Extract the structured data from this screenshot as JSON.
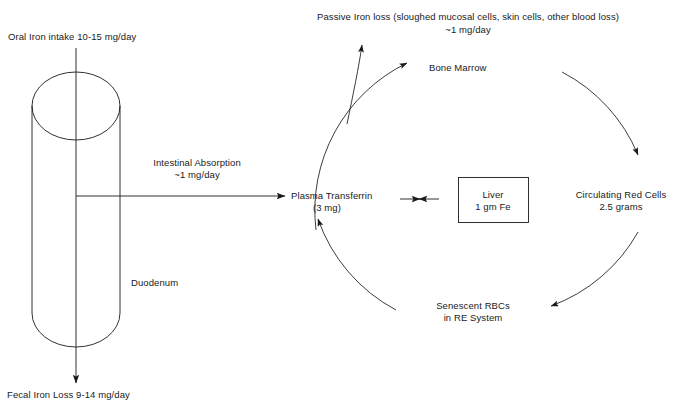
{
  "diagram": {
    "background_color": "#ffffff",
    "stroke_color": "#1a1a1a",
    "text_color": "#1a1a1a"
  },
  "labels": {
    "oral_intake": "Oral Iron intake 10-15 mg/day",
    "duodenum": "Duodenum",
    "fecal_loss": "Fecal Iron Loss 9-14 mg/day",
    "intestinal_absorption_line1": "Intestinal Absorption",
    "intestinal_absorption_line2": "~1 mg/day",
    "passive_loss_line1": "Passive Iron loss (sloughed mucosal cells, skin cells, other blood loss)",
    "passive_loss_line2": "~1 mg/day",
    "bone_marrow": "Bone Marrow",
    "plasma_transferrin_line1": "Plasma Transferrin",
    "plasma_transferrin_line2": "(3 mg)",
    "liver_line1": "Liver",
    "liver_line2": "1 gm Fe",
    "circulating_red_cells_line1": "Circulating Red Cells",
    "circulating_red_cells_line2": "2.5 grams",
    "senescent_rbcs_line1": "Senescent RBCs",
    "senescent_rbcs_line2": "in RE System"
  },
  "nodes": [
    {
      "id": "duodenum",
      "label": "Duodenum",
      "shape": "cylinder"
    },
    {
      "id": "plasma-transferrin",
      "label": "Plasma Transferrin",
      "detail": "(3 mg)"
    },
    {
      "id": "liver",
      "label": "Liver",
      "detail": "1 gm Fe",
      "shape": "rectangle"
    },
    {
      "id": "bone-marrow",
      "label": "Bone Marrow"
    },
    {
      "id": "circulating-red-cells",
      "label": "Circulating Red Cells",
      "detail": "2.5 grams"
    },
    {
      "id": "senescent-rbcs",
      "label": "Senescent RBCs",
      "detail": "in RE System"
    }
  ],
  "flows": [
    {
      "from": "oral-intake",
      "to": "duodenum",
      "value": "10-15 mg/day"
    },
    {
      "from": "duodenum",
      "to": "plasma-transferrin",
      "value": "~1 mg/day",
      "label": "Intestinal Absorption"
    },
    {
      "from": "duodenum",
      "to": "fecal-loss",
      "value": "9-14 mg/day"
    },
    {
      "from": "bone-marrow-path",
      "to": "passive-loss",
      "value": "~1 mg/day",
      "label": "Passive Iron loss"
    },
    {
      "from": "plasma-transferrin",
      "to": "bone-marrow"
    },
    {
      "from": "bone-marrow",
      "to": "circulating-red-cells"
    },
    {
      "from": "circulating-red-cells",
      "to": "senescent-rbcs"
    },
    {
      "from": "senescent-rbcs",
      "to": "plasma-transferrin"
    },
    {
      "from": "plasma-transferrin",
      "to": "liver",
      "bidirectional": true
    }
  ]
}
